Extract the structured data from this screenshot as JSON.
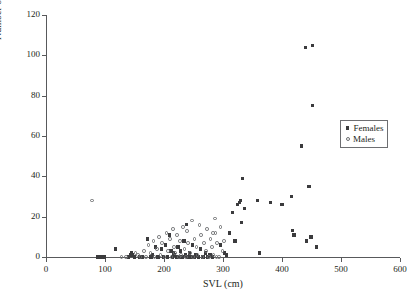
{
  "chart_data": {
    "type": "scatter",
    "title": "",
    "xlabel": "SVL (cm)",
    "ylabel": "Number of Scars",
    "xlim": [
      0,
      600
    ],
    "ylim": [
      0,
      120
    ],
    "xticks": [
      0,
      100,
      200,
      300,
      400,
      500,
      600
    ],
    "yticks": [
      0,
      20,
      40,
      60,
      80,
      100,
      120
    ],
    "grid": false,
    "legend_position": "upper-right",
    "series": [
      {
        "name": "Females",
        "marker": "filled-square",
        "color": "#3b3b3d",
        "points": [
          [
            88,
            0
          ],
          [
            93,
            0
          ],
          [
            99,
            0
          ],
          [
            118,
            4
          ],
          [
            140,
            0
          ],
          [
            143,
            1
          ],
          [
            145,
            2
          ],
          [
            147,
            1
          ],
          [
            150,
            0
          ],
          [
            158,
            0
          ],
          [
            163,
            0
          ],
          [
            172,
            9
          ],
          [
            178,
            0
          ],
          [
            180,
            1
          ],
          [
            186,
            5
          ],
          [
            190,
            0
          ],
          [
            196,
            4
          ],
          [
            199,
            0
          ],
          [
            203,
            6
          ],
          [
            206,
            0
          ],
          [
            209,
            11
          ],
          [
            212,
            3
          ],
          [
            214,
            0
          ],
          [
            216,
            2
          ],
          [
            218,
            1
          ],
          [
            221,
            0
          ],
          [
            224,
            5
          ],
          [
            226,
            0
          ],
          [
            228,
            3
          ],
          [
            231,
            0
          ],
          [
            234,
            8
          ],
          [
            236,
            1
          ],
          [
            238,
            16
          ],
          [
            240,
            0
          ],
          [
            243,
            2
          ],
          [
            246,
            0
          ],
          [
            248,
            6
          ],
          [
            251,
            0
          ],
          [
            254,
            1
          ],
          [
            258,
            0
          ],
          [
            262,
            4
          ],
          [
            266,
            0
          ],
          [
            270,
            2
          ],
          [
            274,
            0
          ],
          [
            278,
            1
          ],
          [
            282,
            0
          ],
          [
            296,
            6
          ],
          [
            303,
            2
          ],
          [
            306,
            1
          ],
          [
            311,
            12
          ],
          [
            316,
            22
          ],
          [
            320,
            8
          ],
          [
            325,
            26
          ],
          [
            328,
            27
          ],
          [
            330,
            28
          ],
          [
            331,
            17
          ],
          [
            333,
            39
          ],
          [
            336,
            24
          ],
          [
            358,
            28
          ],
          [
            362,
            2
          ],
          [
            381,
            27
          ],
          [
            400,
            26
          ],
          [
            416,
            30
          ],
          [
            418,
            13
          ],
          [
            420,
            11
          ],
          [
            433,
            55
          ],
          [
            440,
            104
          ],
          [
            442,
            8
          ],
          [
            446,
            35
          ],
          [
            449,
            10
          ],
          [
            452,
            105
          ],
          [
            458,
            5
          ],
          [
            452,
            75
          ]
        ]
      },
      {
        "name": "Males",
        "marker": "open-circle",
        "color": "#6d6e71",
        "points": [
          [
            78,
            28
          ],
          [
            128,
            0
          ],
          [
            136,
            0
          ],
          [
            152,
            2
          ],
          [
            156,
            1
          ],
          [
            160,
            0
          ],
          [
            166,
            3
          ],
          [
            169,
            0
          ],
          [
            174,
            6
          ],
          [
            177,
            2
          ],
          [
            182,
            8
          ],
          [
            184,
            0
          ],
          [
            188,
            4
          ],
          [
            192,
            10
          ],
          [
            194,
            1
          ],
          [
            197,
            7
          ],
          [
            201,
            0
          ],
          [
            204,
            12
          ],
          [
            207,
            3
          ],
          [
            210,
            9
          ],
          [
            213,
            0
          ],
          [
            215,
            14
          ],
          [
            217,
            5
          ],
          [
            219,
            2
          ],
          [
            222,
            11
          ],
          [
            225,
            0
          ],
          [
            227,
            8
          ],
          [
            229,
            1
          ],
          [
            232,
            15
          ],
          [
            235,
            4
          ],
          [
            237,
            0
          ],
          [
            239,
            13
          ],
          [
            241,
            7
          ],
          [
            244,
            2
          ],
          [
            247,
            18
          ],
          [
            249,
            0
          ],
          [
            252,
            9
          ],
          [
            255,
            5
          ],
          [
            257,
            1
          ],
          [
            260,
            16
          ],
          [
            263,
            11
          ],
          [
            265,
            0
          ],
          [
            268,
            7
          ],
          [
            271,
            3
          ],
          [
            273,
            14
          ],
          [
            276,
            0
          ],
          [
            279,
            9
          ],
          [
            281,
            5
          ],
          [
            284,
            1
          ],
          [
            287,
            12
          ],
          [
            290,
            7
          ],
          [
            293,
            0
          ],
          [
            296,
            15
          ],
          [
            299,
            3
          ],
          [
            302,
            8
          ],
          [
            286,
            19
          ],
          [
            283,
            12
          ],
          [
            289,
            0
          ]
        ]
      }
    ]
  },
  "legend": {
    "entries": [
      {
        "label": "Females"
      },
      {
        "label": "Males"
      }
    ]
  }
}
